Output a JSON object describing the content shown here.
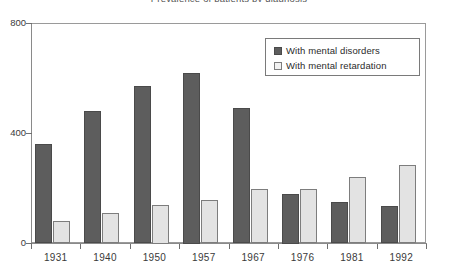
{
  "chart_data": {
    "type": "bar",
    "title": "Prevalence of patients by diagnosis",
    "xlabel": "",
    "ylabel": "",
    "categories": [
      "1931",
      "1940",
      "1950",
      "1957",
      "1967",
      "1976",
      "1981",
      "1992"
    ],
    "series": [
      {
        "name": "With mental disorders",
        "color": "#5d5d5d",
        "values": [
          360,
          480,
          570,
          620,
          490,
          180,
          150,
          135
        ]
      },
      {
        "name": "With mental retardation",
        "color": "#e3e3e3",
        "values": [
          80,
          110,
          140,
          155,
          195,
          195,
          240,
          285
        ]
      }
    ],
    "ylim": [
      0,
      800
    ],
    "yticks": [
      0,
      400,
      800
    ],
    "ytick_labels": [
      "0",
      "400",
      "800"
    ],
    "grid": false,
    "legend_position": "top-right"
  },
  "legend": {
    "items": [
      {
        "label": "With mental disorders"
      },
      {
        "label": "With mental retardation"
      }
    ]
  }
}
